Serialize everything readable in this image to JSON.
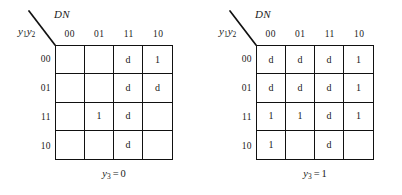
{
  "figure": {
    "maps": [
      {
        "id": "left",
        "corner": {
          "top_label": "DN",
          "left_label_base": "y",
          "left_label_sub1": "1",
          "left_label_base2": "y",
          "left_label_sub2": "2",
          "diagonal_icon": "diagonal-divider-icon"
        },
        "column_headers": [
          "00",
          "01",
          "11",
          "10"
        ],
        "row_headers": [
          "00",
          "01",
          "11",
          "10"
        ],
        "cells": [
          [
            "",
            "",
            "d",
            "1"
          ],
          [
            "",
            "",
            "d",
            "d"
          ],
          [
            "",
            "1",
            "d",
            ""
          ],
          [
            "",
            "",
            "d",
            ""
          ]
        ],
        "caption": {
          "variable": "y",
          "subscript": "3",
          "operator": "=",
          "value": "0"
        }
      },
      {
        "id": "right",
        "corner": {
          "top_label": "DN",
          "left_label_base": "y",
          "left_label_sub1": "1",
          "left_label_base2": "y",
          "left_label_sub2": "2",
          "diagonal_icon": "diagonal-divider-icon"
        },
        "column_headers": [
          "00",
          "01",
          "11",
          "10"
        ],
        "row_headers": [
          "00",
          "01",
          "11",
          "10"
        ],
        "cells": [
          [
            "d",
            "d",
            "d",
            "1"
          ],
          [
            "d",
            "d",
            "d",
            "1"
          ],
          [
            "1",
            "1",
            "d",
            "1"
          ],
          [
            "1",
            "",
            "d",
            ""
          ]
        ],
        "caption": {
          "variable": "y",
          "subscript": "3",
          "operator": "=",
          "value": "1"
        }
      }
    ]
  },
  "colors": {
    "ink": "#111111",
    "background": "#ffffff"
  }
}
